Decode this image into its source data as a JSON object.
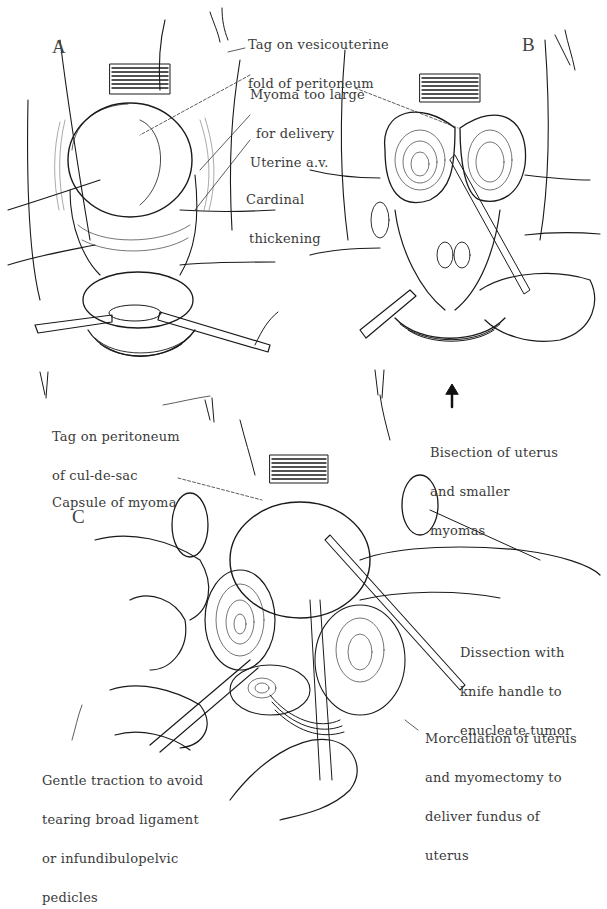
{
  "figure": {
    "type": "surgical-illustration",
    "style": "black-and-white pen line drawing",
    "background": "#ffffff",
    "ink_color": "#1a1a1a",
    "label_color": "#3a3a3a"
  },
  "panels": [
    {
      "id": "A",
      "letter": "A",
      "labels": [
        {
          "lines": [
            "Tag on vesicouterine",
            "fold of peritoneum"
          ]
        },
        {
          "lines": [
            "Myoma too large",
            "for delivery"
          ]
        },
        {
          "lines": [
            "Uterine a.v."
          ]
        },
        {
          "lines": [
            "Cardinal",
            "thickening"
          ]
        },
        {
          "lines": [
            "Tag on peritoneum",
            "of cul-de-sac"
          ]
        }
      ]
    },
    {
      "id": "B",
      "letter": "B",
      "labels": [
        {
          "lines": [
            "Bisection of uterus",
            "and smaller",
            "myomas"
          ]
        }
      ]
    },
    {
      "id": "C",
      "letter": "C",
      "labels": [
        {
          "lines": [
            "Capsule of myoma"
          ]
        },
        {
          "lines": [
            "Dissection with",
            "knife handle to",
            "enucleate tumor"
          ]
        },
        {
          "lines": [
            "Morcellation of uterus",
            "and myomectomy to",
            "deliver fundus of",
            "uterus"
          ]
        },
        {
          "lines": [
            "Gentle traction to avoid",
            "tearing broad ligament",
            "or infundibulopelvic",
            "pedicles"
          ]
        }
      ]
    }
  ]
}
